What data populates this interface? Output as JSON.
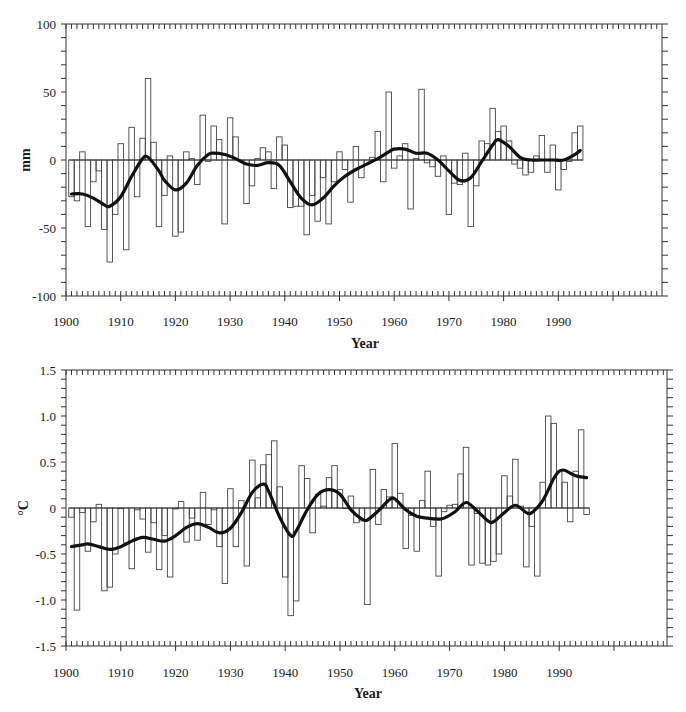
{
  "chart_data": [
    {
      "type": "bar",
      "id": "precipitation",
      "title": "",
      "xlabel": "Year",
      "ylabel": "mm",
      "ylim": [
        -100,
        100
      ],
      "xlim": [
        1900,
        1995
      ],
      "yticks": [
        -100,
        -50,
        0,
        50,
        100
      ],
      "ytick_labels": [
        "-100",
        "-50",
        "0",
        "50",
        "100"
      ],
      "xticks": [
        1900,
        1910,
        1920,
        1930,
        1940,
        1950,
        1960,
        1970,
        1980,
        1990
      ],
      "xtick_labels": [
        "1900",
        "1910",
        "1920",
        "1930",
        "1940",
        "1950",
        "1960",
        "1970",
        "1980",
        "1990"
      ],
      "grid": false,
      "legend": null,
      "series": [
        {
          "name": "Annual anomaly",
          "kind": "bar",
          "x": [
            1901,
            1902,
            1903,
            1904,
            1905,
            1906,
            1907,
            1908,
            1909,
            1910,
            1911,
            1912,
            1913,
            1914,
            1915,
            1916,
            1917,
            1918,
            1919,
            1920,
            1921,
            1922,
            1923,
            1924,
            1925,
            1926,
            1927,
            1928,
            1929,
            1930,
            1931,
            1932,
            1933,
            1934,
            1935,
            1936,
            1937,
            1938,
            1939,
            1940,
            1941,
            1942,
            1943,
            1944,
            1945,
            1946,
            1947,
            1948,
            1949,
            1950,
            1951,
            1952,
            1953,
            1954,
            1955,
            1956,
            1957,
            1958,
            1959,
            1960,
            1961,
            1962,
            1963,
            1964,
            1965,
            1966,
            1967,
            1968,
            1969,
            1970,
            1971,
            1972,
            1973,
            1974,
            1975,
            1976,
            1977,
            1978,
            1979,
            1980,
            1981,
            1982,
            1983,
            1984,
            1985,
            1986,
            1987,
            1988,
            1989,
            1990,
            1991,
            1992,
            1993,
            1994
          ],
          "values": [
            -27,
            -30,
            6,
            -49,
            -16,
            -8,
            -51,
            -75,
            -40,
            12,
            -66,
            24,
            -27,
            16,
            60,
            13,
            -49,
            -26,
            3,
            -56,
            -53,
            6,
            1,
            -18,
            33,
            -1,
            25,
            15,
            -47,
            31,
            17,
            -1,
            -32,
            -19,
            1,
            9,
            6,
            -21,
            17,
            11,
            -35,
            -34,
            -34,
            -55,
            -26,
            -45,
            -13,
            -47,
            -16,
            6,
            -7,
            -31,
            10,
            -13,
            -3,
            2,
            21,
            -16,
            50,
            -6,
            3,
            12,
            -36,
            1,
            52,
            -2,
            -5,
            -12,
            3,
            -40,
            -17,
            -18,
            5,
            -49,
            -19,
            14,
            12,
            38,
            21,
            25,
            14,
            -3,
            -6,
            -11,
            -9,
            3,
            18,
            -9,
            11,
            -22,
            -7,
            -1,
            20,
            25
          ]
        },
        {
          "name": "Smoothed",
          "kind": "line",
          "x": [
            1901,
            1903,
            1905,
            1907,
            1908,
            1910,
            1912,
            1914,
            1915,
            1917,
            1918,
            1920,
            1922,
            1924,
            1926,
            1927,
            1929,
            1931,
            1933,
            1935,
            1937,
            1939,
            1941,
            1943,
            1945,
            1947,
            1949,
            1951,
            1953,
            1955,
            1957,
            1959,
            1960,
            1962,
            1964,
            1966,
            1968,
            1970,
            1972,
            1974,
            1976,
            1978,
            1979,
            1981,
            1983,
            1985,
            1987,
            1989,
            1991,
            1993,
            1994
          ],
          "values": [
            -25,
            -25,
            -28,
            -33,
            -34,
            -27,
            -12,
            1,
            2,
            -8,
            -15,
            -22,
            -17,
            -4,
            4,
            5,
            4,
            1,
            -3,
            -4,
            -2,
            -4,
            -16,
            -28,
            -33,
            -28,
            -19,
            -12,
            -7,
            -3,
            1,
            6,
            8,
            8,
            5,
            5,
            0,
            -8,
            -15,
            -13,
            -1,
            11,
            15,
            10,
            2,
            0,
            0,
            0,
            0,
            4,
            7
          ]
        }
      ]
    },
    {
      "type": "bar",
      "id": "temperature",
      "title": "",
      "xlabel": "Year",
      "ylabel": "°C",
      "ylim": [
        -1.5,
        1.5
      ],
      "xlim": [
        1900,
        1996
      ],
      "yticks": [
        -1.5,
        -1.0,
        -0.5,
        0,
        0.5,
        1.0,
        1.5
      ],
      "ytick_labels": [
        "-1.5",
        "-1.0",
        "-0.5",
        "0",
        "0.5",
        "1.0",
        "1.5"
      ],
      "xticks": [
        1900,
        1910,
        1920,
        1930,
        1940,
        1950,
        1960,
        1970,
        1980,
        1990
      ],
      "xtick_labels": [
        "1900",
        "1910",
        "1920",
        "1930",
        "1940",
        "1950",
        "1960",
        "1970",
        "1980",
        "1990"
      ],
      "grid": false,
      "legend": null,
      "series": [
        {
          "name": "Annual anomaly",
          "kind": "bar",
          "x": [
            1901,
            1902,
            1903,
            1904,
            1905,
            1906,
            1907,
            1908,
            1909,
            1910,
            1911,
            1912,
            1913,
            1914,
            1915,
            1916,
            1917,
            1918,
            1919,
            1920,
            1921,
            1922,
            1923,
            1924,
            1925,
            1926,
            1927,
            1928,
            1929,
            1930,
            1931,
            1932,
            1933,
            1934,
            1935,
            1936,
            1937,
            1938,
            1939,
            1940,
            1941,
            1942,
            1943,
            1944,
            1945,
            1946,
            1947,
            1948,
            1949,
            1950,
            1951,
            1952,
            1953,
            1954,
            1955,
            1956,
            1957,
            1958,
            1959,
            1960,
            1961,
            1962,
            1963,
            1964,
            1965,
            1966,
            1967,
            1968,
            1969,
            1970,
            1971,
            1972,
            1973,
            1974,
            1975,
            1976,
            1977,
            1978,
            1979,
            1980,
            1981,
            1982,
            1983,
            1984,
            1985,
            1986,
            1987,
            1988,
            1989,
            1990,
            1991,
            1992,
            1993,
            1994,
            1995
          ],
          "values": [
            -0.1,
            -1.11,
            -0.05,
            -0.47,
            -0.15,
            0.04,
            -0.9,
            -0.86,
            -0.5,
            0.0,
            -0.38,
            -0.66,
            -0.02,
            -0.12,
            -0.48,
            -0.16,
            -0.67,
            -0.3,
            -0.75,
            -0.01,
            0.07,
            -0.37,
            -0.11,
            -0.35,
            0.17,
            -0.18,
            -0.02,
            -0.42,
            -0.82,
            0.21,
            -0.42,
            0.08,
            -0.63,
            0.52,
            0.11,
            0.47,
            0.58,
            0.73,
            0.23,
            -0.75,
            -1.17,
            -1.01,
            0.46,
            0.32,
            -0.27,
            0.15,
            0.02,
            0.33,
            0.46,
            0.2,
            0.0,
            0.13,
            -0.16,
            -0.14,
            -1.05,
            0.42,
            -0.18,
            0.2,
            0.12,
            0.7,
            0.16,
            -0.44,
            -0.08,
            -0.47,
            0.08,
            0.4,
            -0.2,
            -0.74,
            -0.04,
            0.03,
            0.04,
            0.37,
            0.66,
            -0.62,
            -0.06,
            -0.6,
            -0.62,
            -0.58,
            -0.5,
            0.35,
            0.13,
            0.53,
            0.02,
            -0.64,
            -0.2,
            -0.74,
            0.28,
            1.0,
            0.92,
            0.4,
            0.28,
            -0.15,
            0.4,
            0.85,
            -0.07
          ]
        },
        {
          "name": "Smoothed",
          "kind": "line",
          "x": [
            1901,
            1903,
            1904,
            1906,
            1908,
            1910,
            1912,
            1914,
            1916,
            1918,
            1920,
            1922,
            1924,
            1926,
            1928,
            1930,
            1932,
            1934,
            1936,
            1937,
            1939,
            1941,
            1942,
            1944,
            1946,
            1948,
            1950,
            1952,
            1954,
            1955,
            1957,
            1959,
            1960,
            1962,
            1964,
            1966,
            1968,
            1969,
            1971,
            1973,
            1975,
            1977,
            1978,
            1980,
            1982,
            1984,
            1985,
            1987,
            1989,
            1990,
            1991,
            1993,
            1995
          ],
          "values": [
            -0.42,
            -0.4,
            -0.39,
            -0.42,
            -0.45,
            -0.42,
            -0.36,
            -0.32,
            -0.34,
            -0.36,
            -0.3,
            -0.21,
            -0.17,
            -0.21,
            -0.27,
            -0.22,
            -0.05,
            0.17,
            0.26,
            0.18,
            -0.1,
            -0.3,
            -0.25,
            -0.02,
            0.15,
            0.2,
            0.15,
            -0.02,
            -0.12,
            -0.13,
            -0.03,
            0.09,
            0.1,
            -0.02,
            -0.09,
            -0.11,
            -0.12,
            -0.11,
            -0.04,
            0.06,
            -0.03,
            -0.14,
            -0.15,
            -0.05,
            0.03,
            -0.05,
            -0.05,
            0.08,
            0.32,
            0.4,
            0.41,
            0.35,
            0.33
          ]
        }
      ]
    }
  ],
  "charts": {
    "top": {
      "ylabel": "mm",
      "xlabel": "Year"
    },
    "bottom": {
      "ylabel": "°C",
      "xlabel": "Year"
    }
  },
  "colors": {
    "bar_fill": "#f2f2f2",
    "bar_dot": "#8a8a8a",
    "bar_stroke": "#444444",
    "line": "#111111",
    "axis": "#333333"
  }
}
